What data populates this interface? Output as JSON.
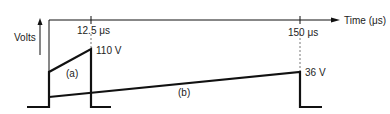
{
  "diagram": {
    "title": "",
    "axes": {
      "y_label": "Volts",
      "x_label": "Time (μs)"
    },
    "markers": {
      "t1": "12.5 μs",
      "t2": "150 μs"
    },
    "values": {
      "v_a_peak": "110 V",
      "v_b_peak": "36 V"
    },
    "curves": {
      "a": "(a)",
      "b": "(b)"
    },
    "colors": {
      "stroke": "#111111",
      "text": "#222222",
      "background": "#ffffff"
    }
  }
}
